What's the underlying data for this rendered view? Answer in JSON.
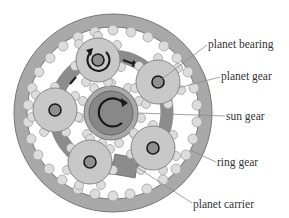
{
  "diagram": {
    "colors": {
      "ring_fill": "#a9a9a9",
      "ring_stroke": "#777777",
      "carrier_fill": "#8c8c8c",
      "planet_fill": "#c8c8c8",
      "tooth_fill": "#dcdcdc",
      "hub_fill": "#8f8f8f",
      "sun_outer": "#a8a8a8",
      "sun_inner": "#888888",
      "arrow": "#1a1a1a",
      "leader_line": "#8a8a8a",
      "label_text": "#333333"
    },
    "labels": [
      {
        "id": "planet-bearing",
        "text": "planet bearing",
        "x": 208,
        "y": 40
      },
      {
        "id": "planet-gear",
        "text": "planet gear",
        "x": 221,
        "y": 72
      },
      {
        "id": "sun-gear",
        "text": "sun gear",
        "x": 226,
        "y": 112
      },
      {
        "id": "ring-gear",
        "text": "ring gear",
        "x": 217,
        "y": 158
      },
      {
        "id": "planet-carrier",
        "text": "planet carrier",
        "x": 193,
        "y": 200
      }
    ],
    "components": {
      "ring_gear": "ring gear",
      "sun_gear": "sun gear",
      "planet_gears": [
        "planet gear",
        "planet gear",
        "planet gear",
        "planet gear",
        "planet gear"
      ],
      "planet_carrier": "planet carrier",
      "planet_bearing": "planet bearing"
    }
  }
}
